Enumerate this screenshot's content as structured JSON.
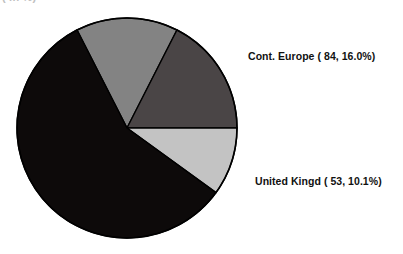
{
  "chart_data": {
    "type": "pie",
    "title": "",
    "clipped_title_remnant": "( in  %)",
    "xlabel": "",
    "ylabel": "",
    "legend_position": "none",
    "grid": false,
    "labels_shown_on_chart": true,
    "center": {
      "x": 127,
      "y": 128
    },
    "radius": 110,
    "outline_color": "#000000",
    "categories": [
      "Cont. Europe",
      "United Kingd"
    ],
    "values": [
      84,
      53
    ],
    "percentages": [
      16.0,
      10.1
    ],
    "slices": [
      {
        "name": "slice-medium-gray",
        "label": "",
        "value": null,
        "percent": 24.6,
        "color": "#838383",
        "start_angle_deg": 333,
        "end_angle_deg": 27,
        "labeled": false
      },
      {
        "name": "slice-cont-europe",
        "label": "Cont. Europe",
        "value": 84,
        "percent": 16.0,
        "color": "#4a4546",
        "start_angle_deg": 27,
        "end_angle_deg": 90,
        "labeled": true,
        "label_text": "Cont. Europe ( 84, 16.0%)"
      },
      {
        "name": "slice-united-kingdom",
        "label": "United Kingd",
        "value": 53,
        "percent": 10.1,
        "color": "#c3c3c3",
        "start_angle_deg": 90,
        "end_angle_deg": 126,
        "labeled": true,
        "label_text": "United Kingd ( 53, 10.1%)"
      },
      {
        "name": "slice-black",
        "label": "",
        "value": null,
        "percent": 49.3,
        "color": "#0d0a0a",
        "start_angle_deg": 126,
        "end_angle_deg": 333,
        "labeled": false
      }
    ]
  },
  "labels": {
    "cont_europe": "Cont. Europe ( 84, 16.0%)",
    "united_kingdom": "United Kingd ( 53, 10.1%)"
  },
  "colors": {
    "background": "#ffffff",
    "outline": "#000000",
    "medium_gray": "#838383",
    "dark_gray": "#4a4546",
    "light_gray": "#c3c3c3",
    "black": "#0d0a0a",
    "label_text": "#111111"
  }
}
